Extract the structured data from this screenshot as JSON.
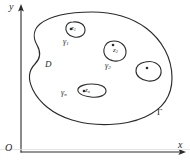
{
  "figure": {
    "kind": "complex-analysis-domain-diagram",
    "background_color": "#ffffff",
    "ink_color": "#2b2b2b",
    "axes": {
      "x_label": "x",
      "y_label": "y",
      "origin_label": "O",
      "x_axis_arrow": "arrow-right",
      "y_axis_arrow": "arrow-up"
    },
    "region": {
      "domain_label": "D",
      "outer_contour_label": "Γ"
    },
    "inner_contours": [
      {
        "contour_label": "γ",
        "contour_sub": "1",
        "point_label": "z",
        "point_sub": "1"
      },
      {
        "contour_label": "γ",
        "contour_sub": "2",
        "point_label": "z",
        "point_sub": "2"
      },
      {
        "contour_label": "",
        "contour_sub": "",
        "point_label": "",
        "point_sub": ""
      },
      {
        "contour_label": "γ",
        "contour_sub": "n",
        "point_label": "z",
        "point_sub": "n"
      }
    ],
    "labels": {
      "y": "y",
      "x": "x",
      "origin": "O",
      "domain": "D",
      "outer_contour": "Γ",
      "gamma1": "γ",
      "gamma1_sub": "1",
      "gamma2": "γ",
      "gamma2_sub": "2",
      "gamman": "γ",
      "gamman_sub": "n",
      "z1": "z",
      "z1_sub": "1",
      "z2": "z",
      "z2_sub": "2",
      "zn": "z",
      "zn_sub": "n"
    }
  }
}
